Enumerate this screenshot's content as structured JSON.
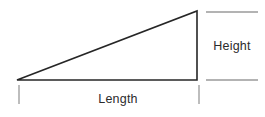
{
  "diagram": {
    "labels": {
      "height": "Height",
      "length": "Length"
    },
    "colors": {
      "triangle_stroke": "#262626",
      "dimension_line": "#9a9a9a",
      "label_text": "#2b2b2b",
      "background": "#ffffff"
    }
  }
}
